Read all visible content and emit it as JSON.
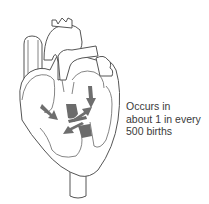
{
  "diagram": {
    "caption_lines": [
      "Occurs in",
      "about 1 in every",
      "500 births"
    ],
    "colors": {
      "outline": "#555555",
      "defect_fill": "#6b6b6b",
      "arrow_fill": "#6e6e6e",
      "caption_text": "#3a3a3a",
      "background": "#ffffff"
    },
    "arrows": [
      {
        "name": "arrow-left-atrium-to-center",
        "direction": "down-right"
      },
      {
        "name": "arrow-right-atrium-down",
        "direction": "down"
      },
      {
        "name": "arrow-center-up-right",
        "direction": "up-right"
      },
      {
        "name": "arrow-center-down-left",
        "direction": "down-left"
      }
    ]
  }
}
